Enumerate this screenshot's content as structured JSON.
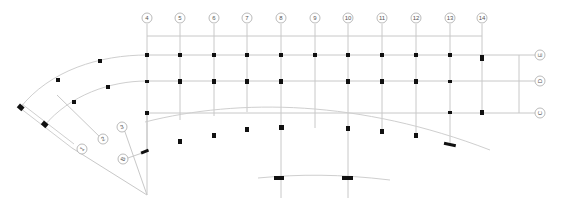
{
  "drawing": {
    "type": "structural grid plan",
    "colors": {
      "gridline": "#c8c8c8",
      "column": "#111111",
      "bubble_stroke": "#a8a8a8",
      "text": "#555555"
    },
    "top_axes": [
      {
        "label": "4",
        "x": 147
      },
      {
        "label": "5",
        "x": 180
      },
      {
        "label": "6",
        "x": 214
      },
      {
        "label": "7",
        "x": 247
      },
      {
        "label": "8",
        "x": 281
      },
      {
        "label": "9",
        "x": 315
      },
      {
        "label": "10",
        "x": 348
      },
      {
        "label": "11",
        "x": 382
      },
      {
        "label": "12",
        "x": 416
      },
      {
        "label": "13",
        "x": 450
      },
      {
        "label": "14",
        "x": 482
      }
    ],
    "right_axes": [
      {
        "label": "E",
        "y": 55
      },
      {
        "label": "D",
        "y": 81
      },
      {
        "label": "C",
        "y": 113
      }
    ],
    "radial_axes": [
      {
        "label": "1"
      },
      {
        "label": "2"
      },
      {
        "label": "3"
      },
      {
        "label": "B"
      }
    ]
  }
}
